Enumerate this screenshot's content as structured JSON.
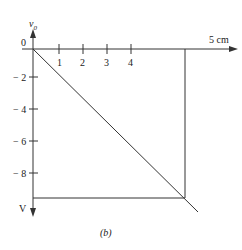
{
  "diagram": {
    "caption": "(b)",
    "y_axis": {
      "label": "v",
      "label_sub": "0",
      "unit": "V",
      "ticks": [
        {
          "value": 0,
          "label": "0"
        },
        {
          "value": -2,
          "label": "− 2"
        },
        {
          "value": -4,
          "label": "− 4"
        },
        {
          "value": -6,
          "label": "− 6"
        },
        {
          "value": -8,
          "label": "− 8"
        }
      ]
    },
    "x_axis": {
      "end_label": "5 cm",
      "ticks": [
        {
          "value": 1,
          "label": "1"
        },
        {
          "value": 2,
          "label": "2"
        },
        {
          "value": 3,
          "label": "3"
        },
        {
          "value": 4,
          "label": "4"
        }
      ]
    },
    "colors": {
      "line": "#333333",
      "text": "#222222"
    }
  }
}
